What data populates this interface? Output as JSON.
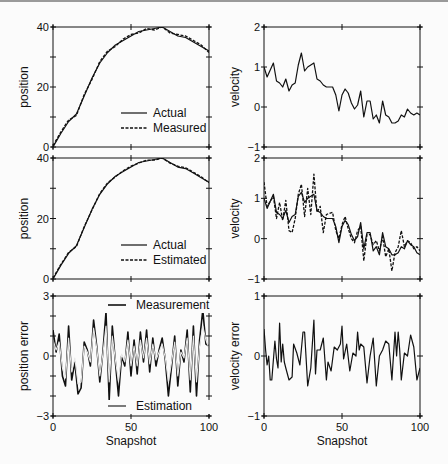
{
  "figure": {
    "background": "#fbfbfb",
    "line_color": "#111111",
    "estimation_color": "#e8e8e8"
  },
  "chart_data": [
    {
      "id": "position-measured",
      "type": "line",
      "panel": "row1-left",
      "title": "",
      "xlabel": "",
      "ylabel": "position",
      "xlim": [
        0,
        100
      ],
      "ylim": [
        0,
        40
      ],
      "xticks": [
        0,
        50,
        100
      ],
      "yticks": [
        0,
        20,
        40
      ],
      "ytick_labels": [
        "0",
        "20",
        "40"
      ],
      "minor_yticks": [
        10,
        30
      ],
      "legend": [
        "Actual",
        "Measured"
      ],
      "legend_position": "lower right",
      "x": [
        0,
        5,
        10,
        15,
        20,
        25,
        30,
        35,
        40,
        45,
        50,
        55,
        60,
        65,
        70,
        75,
        80,
        85,
        90,
        95,
        100
      ],
      "series": [
        {
          "name": "Actual",
          "style": "solid",
          "values": [
            0,
            4.5,
            8.5,
            11,
            17,
            23,
            28,
            31.5,
            34,
            35.5,
            37,
            38.5,
            39,
            39.5,
            40,
            38.5,
            37,
            36.5,
            35,
            33.5,
            32
          ]
        },
        {
          "name": "Measured",
          "style": "dashed",
          "values": [
            0.5,
            5,
            9,
            10.5,
            17.5,
            22.5,
            28.5,
            32,
            33.5,
            36,
            37.5,
            38,
            39.5,
            39,
            40,
            38,
            37.5,
            37,
            35.5,
            34,
            31.5
          ]
        }
      ]
    },
    {
      "id": "velocity-actual",
      "type": "line",
      "panel": "row1-right",
      "ylabel": "velocity",
      "xlim": [
        0,
        100
      ],
      "ylim": [
        -1,
        2
      ],
      "xticks": [
        0,
        50,
        100
      ],
      "yticks": [
        -1,
        0,
        1,
        2
      ],
      "ytick_labels": [
        "−1",
        "0",
        "1",
        "2"
      ],
      "x": [
        0,
        2,
        6,
        8,
        10,
        12,
        14,
        16,
        18,
        20,
        22,
        24,
        26,
        28,
        30,
        32,
        34,
        36,
        38,
        40,
        44,
        46,
        48,
        50,
        52,
        54,
        56,
        58,
        60,
        62,
        64,
        66,
        68,
        70,
        72,
        74,
        76,
        78,
        80,
        82,
        84,
        86,
        88,
        90,
        92,
        94,
        96,
        98,
        100
      ],
      "series": [
        {
          "name": "Actual",
          "style": "solid",
          "values": [
            1.0,
            0.75,
            1.1,
            0.65,
            0.6,
            0.5,
            0.7,
            0.4,
            0.55,
            0.6,
            1.05,
            1.35,
            0.9,
            1.0,
            1.05,
            1.1,
            0.7,
            0.65,
            0.55,
            0.5,
            0.5,
            0.3,
            -0.1,
            0.3,
            0.45,
            0.35,
            0.1,
            -0.05,
            0.05,
            0.4,
            -0.25,
            0.15,
            0.15,
            -0.3,
            -0.2,
            -0.4,
            0.15,
            -0.2,
            -0.25,
            -0.4,
            -0.4,
            -0.35,
            -0.2,
            -0.25,
            -0.05,
            -0.15,
            -0.2,
            -0.15,
            -0.2
          ]
        }
      ]
    },
    {
      "id": "position-estimated",
      "type": "line",
      "panel": "row2-left",
      "ylabel": "position",
      "xlim": [
        0,
        100
      ],
      "ylim": [
        0,
        40
      ],
      "xticks": [
        0,
        50,
        100
      ],
      "yticks": [
        0,
        20,
        40
      ],
      "ytick_labels": [
        "0",
        "20",
        "40"
      ],
      "minor_yticks": [
        10,
        30
      ],
      "legend": [
        "Actual",
        "Estimated"
      ],
      "legend_position": "lower right",
      "x": [
        0,
        5,
        10,
        15,
        20,
        25,
        30,
        35,
        40,
        45,
        50,
        55,
        60,
        65,
        70,
        75,
        80,
        85,
        90,
        95,
        100
      ],
      "series": [
        {
          "name": "Actual",
          "style": "solid",
          "values": [
            0,
            4.5,
            8.5,
            11,
            17,
            23,
            28,
            31.5,
            34,
            35.5,
            37,
            38.5,
            39,
            39.5,
            40,
            38.5,
            37,
            36.5,
            35,
            33.5,
            32
          ]
        },
        {
          "name": "Estimated",
          "style": "dashed",
          "values": [
            0.3,
            4.8,
            8.8,
            10.7,
            17.3,
            22.8,
            28.3,
            31.8,
            33.8,
            35.8,
            37.3,
            38.3,
            39.3,
            39.3,
            40,
            38.3,
            37.3,
            36.8,
            35.3,
            33.8,
            31.8
          ]
        }
      ]
    },
    {
      "id": "velocity-estimated",
      "type": "line",
      "panel": "row2-right",
      "ylabel": "velocity",
      "xlim": [
        0,
        100
      ],
      "ylim": [
        -1,
        2
      ],
      "xticks": [
        0,
        50,
        100
      ],
      "yticks": [
        -1,
        0,
        1,
        2
      ],
      "ytick_labels": [
        "−1",
        "0",
        "1",
        "2"
      ],
      "x": [
        0,
        2,
        6,
        8,
        10,
        12,
        14,
        16,
        18,
        20,
        22,
        24,
        26,
        28,
        30,
        32,
        34,
        36,
        38,
        40,
        44,
        46,
        48,
        50,
        52,
        54,
        56,
        58,
        60,
        62,
        64,
        66,
        68,
        70,
        72,
        74,
        76,
        78,
        80,
        82,
        84,
        86,
        88,
        90,
        92,
        94,
        96,
        98,
        100
      ],
      "series": [
        {
          "name": "Actual",
          "style": "solid",
          "values": [
            1.0,
            0.75,
            1.1,
            0.65,
            0.6,
            0.5,
            0.7,
            0.4,
            0.55,
            0.6,
            1.05,
            1.15,
            0.9,
            1.0,
            1.05,
            1.1,
            0.7,
            0.65,
            0.55,
            0.5,
            0.5,
            0.3,
            -0.1,
            0.3,
            0.45,
            0.35,
            0.1,
            -0.05,
            0.05,
            0.4,
            -0.25,
            0.15,
            0.15,
            -0.3,
            -0.2,
            -0.4,
            0.15,
            -0.2,
            -0.25,
            -0.4,
            -0.4,
            -0.35,
            -0.2,
            -0.25,
            -0.05,
            -0.15,
            -0.2,
            -0.35,
            -0.4
          ]
        },
        {
          "name": "Estimated",
          "style": "dashed",
          "values": [
            1.4,
            0.8,
            1.05,
            0.5,
            0.9,
            0.45,
            0.95,
            0.2,
            0.15,
            0.5,
            1.1,
            1.35,
            0.55,
            1.25,
            0.6,
            1.6,
            0.65,
            0.8,
            0.15,
            0.6,
            0.65,
            0.2,
            0.0,
            0.35,
            0.55,
            0.25,
            0.0,
            -0.1,
            0.2,
            0.3,
            -0.55,
            0.1,
            0.1,
            -0.15,
            -0.05,
            -0.3,
            0.05,
            -0.45,
            -0.25,
            -0.8,
            -0.35,
            -0.2,
            0.2,
            -0.2,
            -0.05,
            -0.1,
            -0.25,
            -0.2,
            -0.3
          ]
        }
      ]
    },
    {
      "id": "position-error",
      "type": "line",
      "panel": "row3-left",
      "xlabel": "Snapshot",
      "ylabel": "position error",
      "xlim": [
        0,
        100
      ],
      "ylim": [
        -3,
        3
      ],
      "xticks": [
        0,
        50,
        100
      ],
      "xtick_labels": [
        "0",
        "50",
        "100"
      ],
      "yticks": [
        -3,
        0,
        3
      ],
      "ytick_labels": [
        "−3",
        "0",
        "3"
      ],
      "minor_yticks": [
        -2,
        -1,
        1,
        2
      ],
      "legend": [
        "Measurement",
        "Estimation"
      ],
      "x": [
        0,
        2,
        4,
        6,
        8,
        10,
        12,
        14,
        16,
        18,
        20,
        22,
        24,
        26,
        28,
        30,
        32,
        34,
        36,
        38,
        40,
        42,
        44,
        46,
        48,
        50,
        52,
        54,
        56,
        58,
        60,
        62,
        64,
        66,
        68,
        70,
        72,
        74,
        76,
        78,
        80,
        82,
        84,
        86,
        88,
        90,
        92,
        94,
        96,
        98,
        100
      ],
      "series": [
        {
          "name": "Measurement",
          "color": "#111111",
          "values": [
            1.3,
            0.2,
            1.1,
            -1.0,
            -1.5,
            1.5,
            -1.2,
            -0.3,
            -1.9,
            -1.6,
            0.7,
            0.3,
            -0.5,
            1.8,
            0.5,
            -1.3,
            0.2,
            2.2,
            -2.2,
            1.5,
            -0.3,
            -2.0,
            0.0,
            -0.5,
            1.2,
            -1.0,
            0.8,
            -0.9,
            1.2,
            -0.3,
            1.3,
            -0.8,
            0.9,
            -0.5,
            0.3,
            0.9,
            -0.2,
            -2.0,
            -0.5,
            1.0,
            -1.5,
            0.3,
            -0.3,
            1.3,
            -1.8,
            1.5,
            -2.0,
            0.8,
            2.3,
            0.6,
            0.5
          ]
        },
        {
          "name": "Estimation",
          "color": "#e8e8e8",
          "values": [
            0.8,
            0.3,
            0.7,
            -0.6,
            -1.1,
            0.9,
            -0.8,
            -0.1,
            -1.4,
            -1.3,
            0.5,
            0.2,
            -0.3,
            1.4,
            0.4,
            -1.0,
            0.1,
            1.5,
            -1.3,
            1.0,
            -0.2,
            -1.3,
            0.1,
            -0.3,
            0.8,
            -0.5,
            0.5,
            -0.5,
            0.8,
            -0.1,
            0.9,
            -0.4,
            0.6,
            -0.2,
            0.2,
            0.6,
            -0.1,
            -1.3,
            -0.3,
            0.7,
            -1.0,
            0.2,
            -0.1,
            0.9,
            -1.2,
            1.0,
            -1.3,
            0.5,
            1.5,
            0.8,
            0.4
          ]
        }
      ]
    },
    {
      "id": "velocity-error",
      "type": "line",
      "panel": "row3-right",
      "xlabel": "Snapshot",
      "ylabel": "velocity error",
      "xlim": [
        0,
        100
      ],
      "ylim": [
        -1,
        1
      ],
      "xticks": [
        0,
        50,
        100
      ],
      "xtick_labels": [
        "0",
        "50",
        "100"
      ],
      "yticks": [
        -1,
        0,
        1
      ],
      "ytick_labels": [
        "−1",
        "0",
        "1"
      ],
      "x": [
        0,
        1,
        2,
        3,
        4,
        5,
        7,
        8,
        9,
        10,
        11,
        12,
        13,
        14,
        16,
        18,
        19,
        21,
        23,
        25,
        26,
        28,
        30,
        32,
        33,
        34,
        36,
        38,
        40,
        41,
        43,
        45,
        47,
        49,
        50,
        51,
        53,
        55,
        57,
        59,
        60,
        61,
        62,
        64,
        66,
        68,
        70,
        72,
        74,
        76,
        78,
        80,
        82,
        84,
        85,
        86,
        87,
        88,
        90,
        92,
        94,
        96,
        98,
        100
      ],
      "series": [
        {
          "name": "Velocity error",
          "style": "solid",
          "values": [
            0.45,
            0.1,
            -0.15,
            0.0,
            -0.4,
            -0.4,
            0.25,
            -0.05,
            -0.2,
            0.55,
            -0.1,
            0.2,
            -0.1,
            -0.2,
            -0.4,
            -0.35,
            0.2,
            0.05,
            -0.15,
            0.4,
            0.4,
            -0.5,
            -0.2,
            0.6,
            -0.3,
            0.1,
            0.1,
            0.3,
            -0.4,
            -0.1,
            -0.25,
            0.15,
            0.1,
            0.2,
            0.5,
            -0.05,
            0.2,
            -0.25,
            0.05,
            0.0,
            0.4,
            0.1,
            0.2,
            0.15,
            -0.45,
            0.0,
            0.3,
            -0.5,
            0.0,
            0.1,
            0.25,
            0.2,
            -0.4,
            0.4,
            0.0,
            0.4,
            0.1,
            -0.4,
            0.05,
            0.0,
            0.35,
            0.15,
            -0.4,
            -0.2
          ]
        }
      ]
    }
  ]
}
